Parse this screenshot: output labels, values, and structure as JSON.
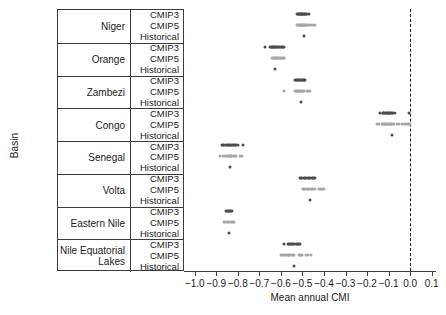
{
  "axes": {
    "y_title": "Basin",
    "x_title": "Mean annual CMI",
    "x_ticks": [
      "-1.0",
      "-0.9",
      "-0.8",
      "-0.7",
      "-0.6",
      "-0.5",
      "-0.4",
      "-0.3",
      "-0.2",
      "-0.1",
      "0.0",
      "0.1"
    ]
  },
  "scenario_labels": {
    "cmip3": "CMIP3",
    "cmip5": "CMIP5",
    "historical": "Historical"
  },
  "basins": [
    {
      "name": "Niger"
    },
    {
      "name": "Orange"
    },
    {
      "name": "Zambezi"
    },
    {
      "name": "Congo"
    },
    {
      "name": "Senegal"
    },
    {
      "name": "Volta"
    },
    {
      "name": "Eastern Nile"
    },
    {
      "name": "Nile Equatorial\nLakes"
    }
  ],
  "colors": {
    "cmip3": "#4d4d4d",
    "cmip5": "#a6a6a6",
    "historical": "#4d4d4d",
    "axis": "#3c3c3c",
    "zero_line": "#1a1a1a"
  },
  "chart_data": {
    "type": "scatter",
    "title": "",
    "xlabel": "Mean annual CMI",
    "ylabel": "Basin",
    "xlim": [
      -1.05,
      0.12
    ],
    "xticks": [
      -1.0,
      -0.9,
      -0.8,
      -0.7,
      -0.6,
      -0.5,
      -0.4,
      -0.3,
      -0.2,
      -0.1,
      0.0,
      0.1
    ],
    "grid": false,
    "legend": "none",
    "annotations": [
      {
        "type": "vline",
        "x": 0.0,
        "style": "dashed"
      }
    ],
    "categories": [
      "Niger",
      "Orange",
      "Zambezi",
      "Congo",
      "Senegal",
      "Volta",
      "Eastern Nile",
      "Nile Equatorial Lakes"
    ],
    "scenarios": [
      "CMIP3",
      "CMIP5",
      "Historical"
    ],
    "series": [
      {
        "name": "Niger",
        "rows": [
          {
            "scenario": "CMIP3",
            "values": [
              -0.527,
              -0.522,
              -0.518,
              -0.515,
              -0.512,
              -0.509,
              -0.506,
              -0.503,
              -0.5,
              -0.497,
              -0.494,
              -0.491,
              -0.487,
              -0.483,
              -0.478,
              -0.47
            ]
          },
          {
            "scenario": "CMIP5",
            "values": [
              -0.524,
              -0.519,
              -0.516,
              -0.513,
              -0.51,
              -0.507,
              -0.504,
              -0.501,
              -0.498,
              -0.495,
              -0.491,
              -0.487,
              -0.483,
              -0.478,
              -0.472,
              -0.466,
              -0.46,
              -0.452,
              -0.444
            ]
          },
          {
            "scenario": "Historical",
            "values": [
              -0.492
            ]
          }
        ]
      },
      {
        "name": "Orange",
        "rows": [
          {
            "scenario": "CMIP3",
            "values": [
              -0.672,
              -0.651,
              -0.646,
              -0.642,
              -0.638,
              -0.634,
              -0.63,
              -0.626,
              -0.622,
              -0.618,
              -0.614,
              -0.61,
              -0.606,
              -0.601,
              -0.596,
              -0.59,
              -0.584
            ]
          },
          {
            "scenario": "CMIP5",
            "values": [
              -0.64,
              -0.636,
              -0.632,
              -0.628,
              -0.624,
              -0.62,
              -0.616,
              -0.612,
              -0.608,
              -0.604,
              -0.6,
              -0.596,
              -0.592,
              -0.588,
              -0.584
            ]
          },
          {
            "scenario": "Historical",
            "values": [
              -0.629
            ]
          }
        ]
      },
      {
        "name": "Zambezi",
        "rows": [
          {
            "scenario": "CMIP3",
            "values": [
              -0.536,
              -0.531,
              -0.527,
              -0.523,
              -0.519,
              -0.515,
              -0.511,
              -0.507,
              -0.503,
              -0.499,
              -0.495,
              -0.491,
              -0.486
            ]
          },
          {
            "scenario": "CMIP5",
            "values": [
              -0.585,
              -0.536,
              -0.531,
              -0.527,
              -0.523,
              -0.519,
              -0.515,
              -0.511,
              -0.507,
              -0.503,
              -0.498,
              -0.493,
              -0.479,
              -0.473,
              -0.465
            ]
          },
          {
            "scenario": "Historical",
            "values": [
              -0.508
            ]
          }
        ]
      },
      {
        "name": "Congo",
        "rows": [
          {
            "scenario": "CMIP3",
            "values": [
              -0.14,
              -0.128,
              -0.124,
              -0.12,
              -0.116,
              -0.112,
              -0.108,
              -0.104,
              -0.1,
              -0.096,
              -0.092,
              -0.088,
              -0.084,
              -0.08,
              -0.07,
              -0.004
            ]
          },
          {
            "scenario": "CMIP5",
            "values": [
              -0.156,
              -0.144,
              -0.132,
              -0.126,
              -0.122,
              -0.118,
              -0.114,
              -0.11,
              -0.106,
              -0.102,
              -0.098,
              -0.094,
              -0.09,
              -0.086,
              -0.082,
              -0.074,
              -0.062,
              -0.05,
              -0.04,
              -0.03,
              -0.02,
              -0.012,
              -0.006,
              0.0
            ]
          },
          {
            "scenario": "Historical",
            "values": [
              -0.083
            ]
          }
        ]
      },
      {
        "name": "Senegal",
        "rows": [
          {
            "scenario": "CMIP3",
            "values": [
              -0.875,
              -0.868,
              -0.862,
              -0.857,
              -0.852,
              -0.847,
              -0.842,
              -0.837,
              -0.832,
              -0.827,
              -0.822,
              -0.817,
              -0.812,
              -0.807,
              -0.8,
              -0.778
            ]
          },
          {
            "scenario": "CMIP5",
            "values": [
              -0.882,
              -0.867,
              -0.858,
              -0.85,
              -0.845,
              -0.84,
              -0.835,
              -0.83,
              -0.825,
              -0.82,
              -0.815,
              -0.808,
              -0.789,
              -0.783
            ]
          },
          {
            "scenario": "Historical",
            "values": [
              -0.838
            ]
          }
        ]
      },
      {
        "name": "Volta",
        "rows": [
          {
            "scenario": "CMIP3",
            "values": [
              -0.513,
              -0.506,
              -0.5,
              -0.494,
              -0.488,
              -0.482,
              -0.476,
              -0.47,
              -0.464,
              -0.458,
              -0.452,
              -0.446,
              -0.44
            ]
          },
          {
            "scenario": "CMIP5",
            "values": [
              -0.498,
              -0.492,
              -0.486,
              -0.48,
              -0.474,
              -0.468,
              -0.462,
              -0.456,
              -0.45,
              -0.444,
              -0.424,
              -0.416,
              -0.408,
              -0.4
            ]
          },
          {
            "scenario": "Historical",
            "values": [
              -0.466
            ]
          }
        ]
      },
      {
        "name": "Eastern Nile",
        "rows": [
          {
            "scenario": "CMIP3",
            "values": [
              -0.856,
              -0.851,
              -0.846,
              -0.841,
              -0.836,
              -0.831,
              -0.826
            ]
          },
          {
            "scenario": "CMIP5",
            "values": [
              -0.864,
              -0.858,
              -0.852,
              -0.846,
              -0.84,
              -0.834,
              -0.828,
              -0.822,
              -0.816
            ]
          },
          {
            "scenario": "Historical",
            "values": [
              -0.84
            ]
          }
        ]
      },
      {
        "name": "Nile Equatorial Lakes",
        "rows": [
          {
            "scenario": "CMIP3",
            "values": [
              -0.587,
              -0.567,
              -0.562,
              -0.557,
              -0.552,
              -0.547,
              -0.542,
              -0.537,
              -0.532,
              -0.527,
              -0.522,
              -0.517,
              -0.512
            ]
          },
          {
            "scenario": "CMIP5",
            "values": [
              -0.6,
              -0.593,
              -0.586,
              -0.58,
              -0.574,
              -0.568,
              -0.562,
              -0.556,
              -0.55,
              -0.544,
              -0.538,
              -0.518,
              -0.512,
              -0.506,
              -0.5,
              -0.482,
              -0.476,
              -0.462
            ]
          },
          {
            "scenario": "Historical",
            "values": [
              -0.538
            ]
          }
        ]
      }
    ]
  }
}
